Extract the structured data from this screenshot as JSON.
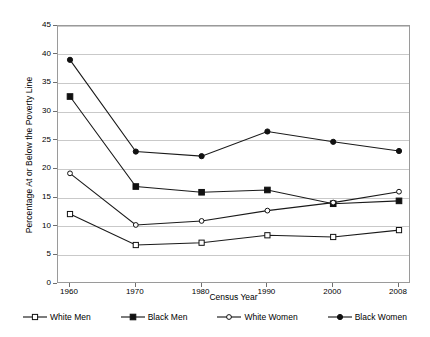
{
  "chart_data": {
    "type": "line",
    "title": "",
    "xlabel": "Census Year",
    "ylabel": "Percentage At or Below the Poverty Line",
    "categories": [
      "1960",
      "1970",
      "1980",
      "1990",
      "2000",
      "2008"
    ],
    "x": [
      1960,
      1970,
      1980,
      1990,
      2000,
      2008
    ],
    "ylim": [
      0,
      45
    ],
    "ytick_values": [
      0,
      5,
      10,
      15,
      20,
      25,
      30,
      35,
      40,
      45
    ],
    "ytick_labels": [
      "0",
      "5",
      "10",
      "15",
      "20",
      "25",
      "30",
      "35",
      "40",
      "45"
    ],
    "grid": true,
    "legend_position": "bottom",
    "series": [
      {
        "name": "White Men",
        "marker": "open-square",
        "color": "#111111",
        "values": [
          12.2,
          6.8,
          7.2,
          8.5,
          8.2,
          9.4
        ]
      },
      {
        "name": "Black Men",
        "marker": "filled-square",
        "color": "#111111",
        "values": [
          32.7,
          17.0,
          16.0,
          16.4,
          14.0,
          14.5
        ]
      },
      {
        "name": "White Women",
        "marker": "open-circle",
        "color": "#111111",
        "values": [
          19.3,
          10.3,
          11.0,
          12.8,
          14.2,
          16.1
        ]
      },
      {
        "name": "Black Women",
        "marker": "filled-circle",
        "color": "#111111",
        "values": [
          39.1,
          23.1,
          22.3,
          26.6,
          24.8,
          23.2
        ]
      }
    ]
  },
  "legend": {
    "items": [
      {
        "label": "White Men",
        "marker": "open-square"
      },
      {
        "label": "Black Men",
        "marker": "filled-square"
      },
      {
        "label": "White Women",
        "marker": "open-circle"
      },
      {
        "label": "Black Women",
        "marker": "filled-circle"
      }
    ]
  }
}
